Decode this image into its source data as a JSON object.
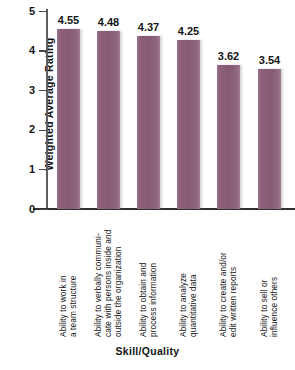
{
  "chart_data": {
    "type": "bar",
    "title": "",
    "xlabel": "Skill/Quality",
    "ylabel": "Weighted Average Rating",
    "ylim": [
      0,
      5
    ],
    "yticks": [
      "0",
      "1",
      "2",
      "3",
      "4",
      "5"
    ],
    "grid": false,
    "legend": "none",
    "bar_color": "#8c6079",
    "categories": [
      "Ability to work in a team structure",
      "Ability to verbally communi-cate with persons inside and outside the organization",
      "Ability to obtain and process information",
      "Ability to analyze quantitative data",
      "Ability to create and/or edit written reports",
      "Ability to sell or influence others"
    ],
    "category_lines": [
      [
        "Ability to work in",
        "a team structure"
      ],
      [
        "Ability to verbally communi-",
        "cate with persons inside and",
        "outside the organization"
      ],
      [
        "Ability to obtain and",
        "process information"
      ],
      [
        "Ability to analyze",
        "quantitative data"
      ],
      [
        "Ability to create and/or",
        "edit written reports"
      ],
      [
        "Ability to sell or",
        "influence others"
      ]
    ],
    "values": [
      4.55,
      4.48,
      4.37,
      4.25,
      3.62,
      3.54
    ],
    "value_labels": [
      "4.55",
      "4.48",
      "4.37",
      "4.25",
      "3.62",
      "3.54"
    ]
  }
}
